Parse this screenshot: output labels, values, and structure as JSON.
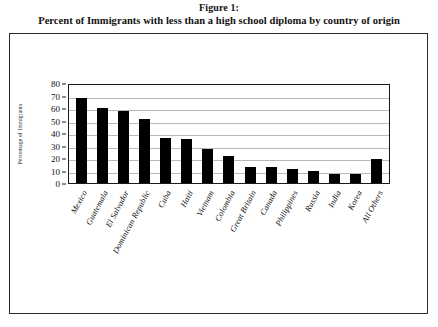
{
  "caption": {
    "figure_number": "Figure 1:",
    "title": "Percent of Immigrants with less than a high school diploma by country of origin"
  },
  "chart_data": {
    "type": "bar",
    "title": "Percent of Immigrants with less than a high school diploma by country of origin",
    "xlabel": "",
    "ylabel": "Percentage of Immigrants",
    "ylim": [
      0,
      80
    ],
    "ytick_step": 10,
    "yticks": [
      "80",
      "70",
      "60",
      "50",
      "40",
      "30",
      "20",
      "10",
      "0"
    ],
    "grid": true,
    "legend": false,
    "bar_color": "#000000",
    "categories": [
      "Mexico",
      "Guatemala",
      "El Salvador",
      "Dominican Republic",
      "Cuba",
      "Haiti",
      "Vietnam",
      "Colombia",
      "Great Britain",
      "Canada",
      "Philippines",
      "Russia",
      "India",
      "Korea",
      "All Others"
    ],
    "values": [
      68,
      60,
      58,
      51,
      36,
      35,
      27,
      22,
      13,
      13,
      11,
      10,
      7,
      7,
      19
    ]
  }
}
